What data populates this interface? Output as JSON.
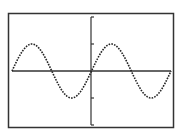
{
  "chart_data": {
    "type": "line",
    "title": "",
    "xlabel": "",
    "ylabel": "",
    "function": "y = sin(x)",
    "xlim": [
      -6.2832,
      6.2832
    ],
    "ylim": [
      -2,
      2
    ],
    "x_ticks": [],
    "y_ticks": [
      -2,
      -1,
      0,
      1,
      2
    ],
    "grid": false,
    "legend": null,
    "series": [
      {
        "name": "sin(x)",
        "style": "dotted",
        "x": [
          -6.2832,
          -4.7124,
          -3.1416,
          -1.5708,
          0,
          1.5708,
          3.1416,
          4.7124,
          6.2832
        ],
        "values": [
          0,
          1,
          0,
          -1,
          0,
          1,
          0,
          -1,
          0
        ]
      }
    ]
  },
  "colors": {
    "frame": "#333333",
    "axis": "#333333",
    "curve": "#222222",
    "background": "#ffffff"
  }
}
